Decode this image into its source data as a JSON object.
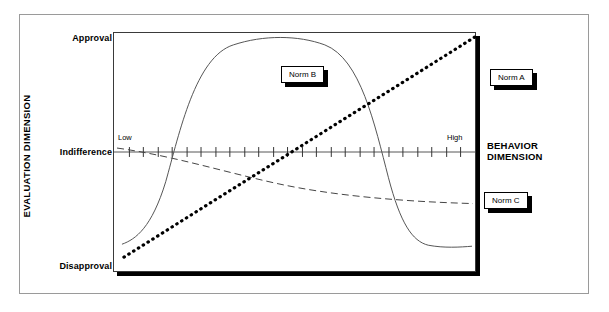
{
  "figure": {
    "y_axis": {
      "title": "EVALUATION DIMENSION",
      "ticks": [
        "Approval",
        "Indifference",
        "Disapproval"
      ]
    },
    "x_axis": {
      "title_line1": "BEHAVIOR",
      "title_line2": "DIMENSION",
      "low_label": "Low",
      "high_label": "High"
    },
    "callouts": {
      "norm_a": "Norm A",
      "norm_b": "Norm B",
      "norm_c": "Norm C"
    }
  },
  "chart_data": {
    "type": "line",
    "title": "",
    "xlabel": "BEHAVIOR DIMENSION",
    "ylabel": "EVALUATION DIMENSION",
    "grid": false,
    "legend_position": "inline-callouts",
    "x_ticklabels": [
      "Low",
      "High"
    ],
    "y_ticklabels": [
      "Disapproval",
      "Indifference",
      "Approval"
    ],
    "ylim": [
      -1,
      1
    ],
    "xlim": [
      0,
      1
    ],
    "annotations": [
      "Norm A",
      "Norm B",
      "Norm C"
    ],
    "axis_tick_count": 24,
    "series": [
      {
        "name": "Norm A",
        "style": "dotted",
        "description": "Monotonically increasing straight line from disapproval at low behavior to approval at high behavior",
        "x": [
          0.04,
          0.15,
          0.3,
          0.45,
          0.6,
          0.75,
          0.9,
          1.0
        ],
        "y": [
          -0.88,
          -0.66,
          -0.37,
          -0.07,
          0.23,
          0.53,
          0.82,
          1.0
        ]
      },
      {
        "name": "Norm B",
        "style": "solid",
        "description": "Bell shaped curve peaking near the middle of the behavior dimension, falling to disapproval at both extremes",
        "x": [
          0.02,
          0.1,
          0.2,
          0.3,
          0.4,
          0.5,
          0.6,
          0.7,
          0.8,
          0.9,
          0.98
        ],
        "y": [
          -0.78,
          -0.55,
          0.25,
          0.78,
          0.92,
          0.94,
          0.88,
          0.6,
          -0.1,
          -0.72,
          -0.8
        ]
      },
      {
        "name": "Norm C",
        "style": "dashed",
        "description": "Gently declining curve from indifference at low behavior toward mild disapproval at high behavior",
        "x": [
          0.02,
          0.15,
          0.3,
          0.45,
          0.6,
          0.75,
          0.9,
          1.0
        ],
        "y": [
          0.03,
          -0.07,
          -0.2,
          -0.3,
          -0.37,
          -0.41,
          -0.43,
          -0.44
        ]
      }
    ]
  }
}
